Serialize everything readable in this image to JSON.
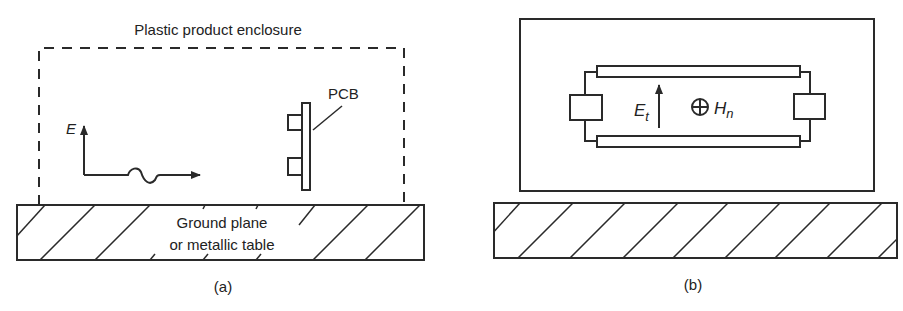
{
  "panel_a": {
    "enclosure_label": "Plastic product enclosure",
    "field_label": "E",
    "pcb_label": "PCB",
    "ground_label_line1": "Ground plane",
    "ground_label_line2": "or metallic table",
    "caption": "(a)"
  },
  "panel_b": {
    "e_label": "E",
    "e_subscript": "t",
    "h_symbol": "⊕",
    "h_label": "H",
    "h_subscript": "n",
    "caption": "(b)"
  },
  "colors": {
    "stroke": "#2a2a2a",
    "background": "#ffffff"
  }
}
